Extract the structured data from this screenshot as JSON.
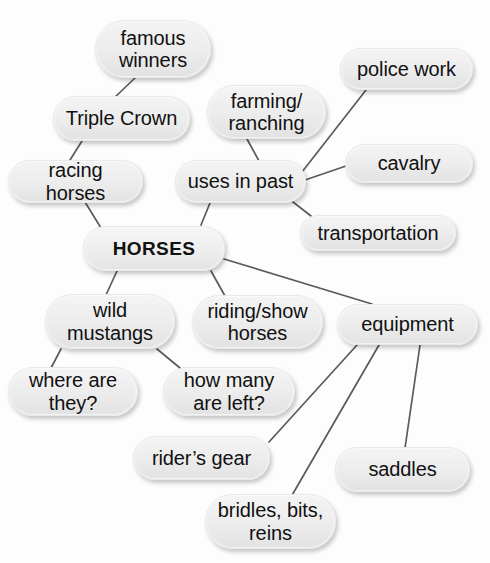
{
  "diagram": {
    "type": "mind-map",
    "center": "HORSES",
    "line_color": "#5a5a5a",
    "node_fill": "#ececec",
    "text_color": "#111111",
    "nodes": [
      {
        "id": "famous-winners",
        "label": "famous\nwinners",
        "x": 95,
        "y": 20,
        "w": 116,
        "h": 58,
        "font": 20,
        "bold": false
      },
      {
        "id": "triple-crown",
        "label": "Triple Crown",
        "x": 53,
        "y": 96,
        "w": 137,
        "h": 45,
        "font": 20,
        "bold": false
      },
      {
        "id": "racing-horses",
        "label": "racing horses",
        "x": 8,
        "y": 160,
        "w": 135,
        "h": 43,
        "font": 20,
        "bold": false
      },
      {
        "id": "horses",
        "label": "HORSES",
        "x": 83,
        "y": 226,
        "w": 142,
        "h": 45,
        "font": 19,
        "bold": true
      },
      {
        "id": "farming-ranching",
        "label": "farming/\nranching",
        "x": 207,
        "y": 85,
        "w": 119,
        "h": 54,
        "font": 20,
        "bold": false
      },
      {
        "id": "uses-in-past",
        "label": "uses in past",
        "x": 175,
        "y": 160,
        "w": 131,
        "h": 43,
        "font": 20,
        "bold": false
      },
      {
        "id": "police-work",
        "label": "police work",
        "x": 340,
        "y": 48,
        "w": 133,
        "h": 42,
        "font": 20,
        "bold": false
      },
      {
        "id": "cavalry",
        "label": "cavalry",
        "x": 345,
        "y": 144,
        "w": 128,
        "h": 39,
        "font": 20,
        "bold": false
      },
      {
        "id": "transportation",
        "label": "transportation",
        "x": 300,
        "y": 215,
        "w": 156,
        "h": 36,
        "font": 20,
        "bold": false
      },
      {
        "id": "wild-mustangs",
        "label": "wild\nmustangs",
        "x": 45,
        "y": 294,
        "w": 130,
        "h": 55,
        "font": 20,
        "bold": false
      },
      {
        "id": "riding-show",
        "label": "riding/show\nhorses",
        "x": 192,
        "y": 295,
        "w": 131,
        "h": 54,
        "font": 20,
        "bold": false
      },
      {
        "id": "equipment",
        "label": "equipment",
        "x": 337,
        "y": 304,
        "w": 141,
        "h": 41,
        "font": 20,
        "bold": false
      },
      {
        "id": "where-are-they",
        "label": "where are\nthey?",
        "x": 8,
        "y": 367,
        "w": 130,
        "h": 49,
        "font": 20,
        "bold": false
      },
      {
        "id": "how-many-left",
        "label": "how many\nare left?",
        "x": 163,
        "y": 367,
        "w": 132,
        "h": 49,
        "font": 20,
        "bold": false
      },
      {
        "id": "riders-gear",
        "label": "rider’s gear",
        "x": 133,
        "y": 436,
        "w": 137,
        "h": 44,
        "font": 20,
        "bold": false
      },
      {
        "id": "saddles",
        "label": "saddles",
        "x": 335,
        "y": 447,
        "w": 135,
        "h": 45,
        "font": 20,
        "bold": false
      },
      {
        "id": "bridles-bits",
        "label": "bridles, bits,\nreins",
        "x": 205,
        "y": 494,
        "w": 131,
        "h": 55,
        "font": 20,
        "bold": false
      }
    ],
    "edges": [
      {
        "from": "famous-winners",
        "to": "triple-crown",
        "x1": 135,
        "y1": 78,
        "x2": 113,
        "y2": 99
      },
      {
        "from": "triple-crown",
        "to": "racing-horses",
        "x1": 82,
        "y1": 141,
        "x2": 70,
        "y2": 160
      },
      {
        "from": "racing-horses",
        "to": "horses",
        "x1": 85,
        "y1": 202,
        "x2": 101,
        "y2": 228
      },
      {
        "from": "horses",
        "to": "uses-in-past",
        "x1": 201,
        "y1": 225,
        "x2": 210,
        "y2": 203
      },
      {
        "from": "farming-ranching",
        "to": "uses-in-past",
        "x1": 247,
        "y1": 139,
        "x2": 259,
        "y2": 161
      },
      {
        "from": "uses-in-past",
        "to": "police-work",
        "x1": 302,
        "y1": 172,
        "x2": 366,
        "y2": 90
      },
      {
        "from": "uses-in-past",
        "to": "cavalry",
        "x1": 305,
        "y1": 180,
        "x2": 346,
        "y2": 166
      },
      {
        "from": "uses-in-past",
        "to": "transportation",
        "x1": 293,
        "y1": 202,
        "x2": 311,
        "y2": 216
      },
      {
        "from": "horses",
        "to": "wild-mustangs",
        "x1": 117,
        "y1": 271,
        "x2": 106,
        "y2": 295
      },
      {
        "from": "horses",
        "to": "riding-show",
        "x1": 211,
        "y1": 271,
        "x2": 225,
        "y2": 296
      },
      {
        "from": "horses",
        "to": "equipment",
        "x1": 224,
        "y1": 259,
        "x2": 372,
        "y2": 304
      },
      {
        "from": "wild-mustangs",
        "to": "where-are-they",
        "x1": 61,
        "y1": 349,
        "x2": 51,
        "y2": 368
      },
      {
        "from": "wild-mustangs",
        "to": "how-many-left",
        "x1": 157,
        "y1": 349,
        "x2": 180,
        "y2": 368
      },
      {
        "from": "equipment",
        "to": "riders-gear",
        "x1": 357,
        "y1": 345,
        "x2": 269,
        "y2": 442
      },
      {
        "from": "equipment",
        "to": "bridles-bits",
        "x1": 379,
        "y1": 345,
        "x2": 291,
        "y2": 497
      },
      {
        "from": "equipment",
        "to": "saddles",
        "x1": 420,
        "y1": 345,
        "x2": 405,
        "y2": 448
      }
    ]
  }
}
